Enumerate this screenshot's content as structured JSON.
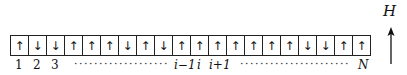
{
  "spins": [
    "up",
    "down",
    "down",
    "up",
    "up",
    "up",
    "down",
    "up",
    "down",
    "up",
    "up",
    "up",
    "up",
    "up",
    "up",
    "up",
    "down",
    "down",
    "up",
    "up"
  ],
  "glyphs": {
    "up": "↑",
    "down": "↓"
  },
  "labels": {
    "site1": "1",
    "site2": "2",
    "site3": "3",
    "dots_left": "································",
    "site_i_minus_1": "i−1",
    "site_i": "i",
    "site_i_plus_1": "i+1",
    "dots_right": "··································",
    "site_N": "N"
  },
  "field": {
    "label": "H",
    "direction": "up"
  }
}
